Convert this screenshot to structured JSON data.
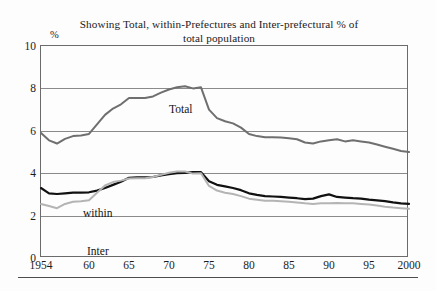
{
  "figure": {
    "title_lines": [
      "Showing Total, within-Prefectures and Inter-prefectural % of",
      "total population"
    ],
    "y_unit_label": "%",
    "background_color": "#fdfdfd",
    "frame_color": "#6b6b6b",
    "grid_color": "#8a8a8a"
  },
  "labels": {
    "total": "Total",
    "within": "within",
    "inter": "Inter"
  },
  "chart_data": {
    "type": "line",
    "title": "Showing Total, within-Prefectures and Inter-prefectural % of total population",
    "xlabel": "",
    "ylabel": "%",
    "xlim": [
      1954,
      2000
    ],
    "ylim": [
      0,
      10
    ],
    "ytick_values": [
      0,
      2,
      4,
      6,
      8,
      10
    ],
    "ytick_labels": [
      "0",
      "2",
      "4",
      "6",
      "8",
      "10"
    ],
    "xtick_values": [
      1954,
      1960,
      1965,
      1970,
      1975,
      1980,
      1985,
      1990,
      1995,
      2000
    ],
    "xtick_labels": [
      "1954",
      "60",
      "65",
      "70",
      "75",
      "80",
      "85",
      "90",
      "95",
      "2000"
    ],
    "grid": "horizontal",
    "legend": "inline-annotations",
    "annotations": [
      {
        "text": "Total",
        "x": 1966,
        "y": 9.1
      },
      {
        "text": "within",
        "x": 1955,
        "y": 4.0
      },
      {
        "text": "Inter",
        "x": 1956,
        "y": 2.2
      }
    ],
    "x": [
      1954,
      1955,
      1956,
      1957,
      1958,
      1959,
      1960,
      1961,
      1962,
      1963,
      1964,
      1965,
      1966,
      1967,
      1968,
      1969,
      1970,
      1971,
      1972,
      1973,
      1974,
      1975,
      1976,
      1977,
      1978,
      1979,
      1980,
      1981,
      1982,
      1983,
      1984,
      1985,
      1986,
      1987,
      1988,
      1989,
      1990,
      1991,
      1992,
      1993,
      1994,
      1995,
      1996,
      1997,
      1998,
      1999,
      2000
    ],
    "series": [
      {
        "name": "Total",
        "color": "#6f6f6f",
        "linewidth": 2.0,
        "values": [
          5.9,
          5.55,
          5.4,
          5.62,
          5.75,
          5.78,
          5.85,
          6.3,
          6.75,
          7.05,
          7.25,
          7.55,
          7.55,
          7.55,
          7.62,
          7.8,
          7.95,
          8.05,
          8.1,
          8.0,
          8.05,
          7.0,
          6.6,
          6.45,
          6.35,
          6.15,
          5.85,
          5.75,
          5.7,
          5.7,
          5.68,
          5.65,
          5.6,
          5.45,
          5.4,
          5.5,
          5.55,
          5.6,
          5.5,
          5.55,
          5.5,
          5.45,
          5.35,
          5.25,
          5.15,
          5.05,
          5.0
        ]
      },
      {
        "name": "within",
        "color": "#111111",
        "linewidth": 2.2,
        "values": [
          3.3,
          3.05,
          3.02,
          3.05,
          3.08,
          3.08,
          3.1,
          3.18,
          3.3,
          3.45,
          3.6,
          3.78,
          3.8,
          3.8,
          3.82,
          3.9,
          3.95,
          4.0,
          4.02,
          4.05,
          4.05,
          3.62,
          3.45,
          3.38,
          3.3,
          3.2,
          3.05,
          2.98,
          2.92,
          2.9,
          2.88,
          2.85,
          2.82,
          2.78,
          2.8,
          2.92,
          3.0,
          2.88,
          2.85,
          2.82,
          2.8,
          2.75,
          2.72,
          2.68,
          2.62,
          2.58,
          2.55
        ]
      },
      {
        "name": "Inter",
        "color": "#b4b4b4",
        "linewidth": 2.0,
        "values": [
          2.55,
          2.45,
          2.35,
          2.55,
          2.65,
          2.68,
          2.72,
          3.08,
          3.42,
          3.58,
          3.65,
          3.75,
          3.76,
          3.76,
          3.82,
          3.92,
          4.02,
          4.08,
          4.08,
          3.98,
          4.0,
          3.4,
          3.18,
          3.08,
          3.02,
          2.92,
          2.8,
          2.75,
          2.7,
          2.7,
          2.68,
          2.65,
          2.62,
          2.58,
          2.55,
          2.58,
          2.58,
          2.6,
          2.58,
          2.58,
          2.55,
          2.52,
          2.48,
          2.42,
          2.38,
          2.35,
          2.32
        ]
      }
    ]
  }
}
